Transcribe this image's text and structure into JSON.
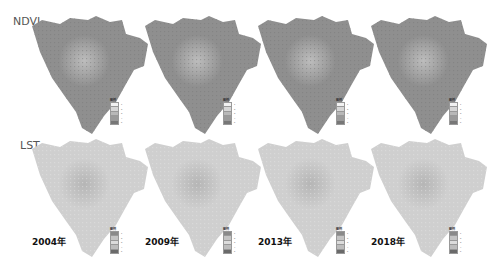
{
  "rows": [
    {
      "label": "NDVI",
      "fill": "#8f8f8f",
      "urban": "#bdbdbd",
      "tex": "#7a7a7a"
    },
    {
      "label": "LST",
      "fill": "#cfcfcf",
      "urban": "#b5b5b5",
      "tex": "#e4e4e4"
    }
  ],
  "years": [
    "2004年",
    "2009年",
    "2013年",
    "2018年"
  ],
  "legend": {
    "title": "图例",
    "ndvi_swatches": [
      "#f2f2f2",
      "#d6d6d6",
      "#b8b8b8",
      "#9a9a9a",
      "#777777"
    ],
    "lst_swatches": [
      "#8a8a8a",
      "#c4c4c4",
      "#dcdcdc",
      "#bdbdbd",
      "#6a6a6a"
    ],
    "entries": [
      "1",
      "2",
      "3",
      "4",
      "5"
    ]
  }
}
